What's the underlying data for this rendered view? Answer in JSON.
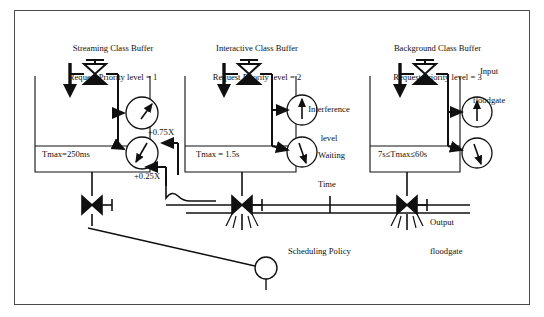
{
  "figure": {
    "type": "process-flow-diagram",
    "background": "#ffffff",
    "line_color": "#101010",
    "frame_color": "#4a4a4a"
  },
  "buffers": [
    {
      "id": "streaming",
      "title_line1": "Streaming Class Buffer",
      "title_line2": "Request Priority level = 1",
      "tank_label": "Tmax=250ms",
      "gauges": [
        {
          "name": "interference-level",
          "arrow": "up-right"
        },
        {
          "name": "waiting-time",
          "arrow": "down-left"
        }
      ]
    },
    {
      "id": "interactive",
      "title_line1": "Interactive Class Buffer",
      "title_line2": "Request Priority level = 2",
      "tank_label": "Tmax = 1.5s",
      "gauges": [
        {
          "name": "interference-level",
          "arrow": "up"
        },
        {
          "name": "waiting-time",
          "arrow": "down-right"
        }
      ]
    },
    {
      "id": "background",
      "title_line1": "Background Class Buffer",
      "title_line2": "Request Priority level = 3",
      "tank_label": "7s≤Tmax≤60s",
      "gauges": [
        {
          "name": "interference-level",
          "arrow": "up"
        },
        {
          "name": "waiting-time",
          "arrow": "down-right"
        }
      ]
    }
  ],
  "annotations": {
    "input_floodgate_line1": "Input",
    "input_floodgate_line2": "floodgate",
    "output_floodgate_line1": "Output",
    "output_floodgate_line2": "floodgate",
    "interference_line1": "Interference",
    "interference_line2": "level",
    "waiting_line1": "Waiting",
    "waiting_line2": "Time",
    "weight_high": "+0.75X",
    "weight_low": "+0.25X",
    "scheduling_policy": "Scheduling Policy"
  }
}
